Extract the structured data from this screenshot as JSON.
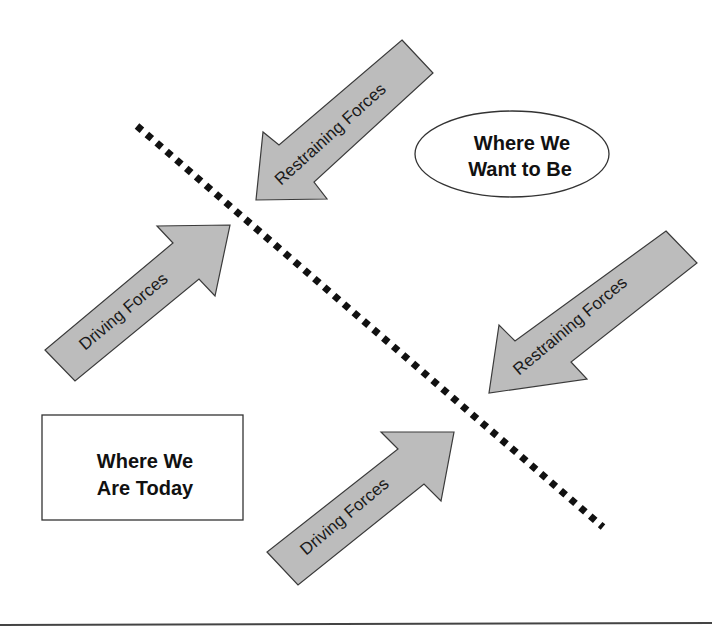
{
  "diagram": {
    "type": "force-field-analysis",
    "divider": {
      "style": "dotted",
      "color": "#111111"
    },
    "states": {
      "current": {
        "line1": "Where We",
        "line2": "Are Today",
        "shape": "rectangle"
      },
      "desired": {
        "line1": "Where We",
        "line2": "Want to Be",
        "shape": "ellipse"
      }
    },
    "arrows": [
      {
        "id": "restraining-1",
        "label": "Restraining Forces",
        "direction": "down-left"
      },
      {
        "id": "driving-1",
        "label": "Driving Forces",
        "direction": "up-right"
      },
      {
        "id": "restraining-2",
        "label": "Restraining Forces",
        "direction": "down-left"
      },
      {
        "id": "driving-2",
        "label": "Driving Forces",
        "direction": "up-right"
      }
    ],
    "colors": {
      "arrow_fill": "#bcbcbc",
      "arrow_stroke": "#3a3a3a",
      "text": "#111111",
      "background": "#ffffff"
    }
  }
}
